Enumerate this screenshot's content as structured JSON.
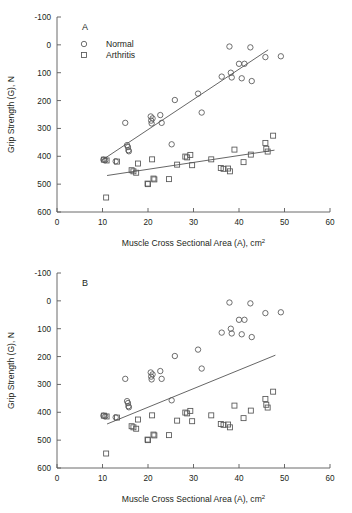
{
  "figure": {
    "panels": [
      {
        "label": "A",
        "legend": {
          "visible": true,
          "entries": [
            {
              "marker": "circle-marker",
              "label": "Normal"
            },
            {
              "marker": "square-marker",
              "label": "Arthritis"
            }
          ]
        }
      },
      {
        "label": "B",
        "legend": {
          "visible": false,
          "entries": []
        }
      }
    ]
  },
  "axis": {
    "xlabel_main": "Muscle Cross Sectional Area (A), cm",
    "xlabel_sup": "2",
    "ylabel": "Grip Strength (G), N",
    "xticks": [
      "0",
      "10",
      "20",
      "30",
      "40",
      "50",
      "60"
    ],
    "yticks": [
      "600",
      "500",
      "400",
      "300",
      "200",
      "100",
      "0",
      "-100"
    ]
  },
  "chart_data": {
    "type": "scatter",
    "title": "",
    "xlabel": "Muscle Cross Sectional Area (A), cm2",
    "ylabel": "Grip Strength (G), N",
    "xlim": [
      0,
      60
    ],
    "ylim": [
      -100,
      600
    ],
    "xticks": [
      0,
      10,
      20,
      30,
      40,
      50,
      60
    ],
    "yticks": [
      -100,
      0,
      100,
      200,
      300,
      400,
      500,
      600
    ],
    "grid": false,
    "legend_position": "upper-left",
    "panels": [
      {
        "label": "A",
        "description": "Separate regression lines fitted to Normal and Arthritis groups",
        "series": [
          {
            "name": "Normal",
            "marker": "circle",
            "points": [
              [
                10.2,
                88
              ],
              [
                10.6,
                86
              ],
              [
                12.9,
                82
              ],
              [
                15.0,
                220
              ],
              [
                15.4,
                140
              ],
              [
                15.6,
                133
              ],
              [
                15.7,
                122
              ],
              [
                15.8,
                118
              ],
              [
                20.6,
                243
              ],
              [
                20.7,
                228
              ],
              [
                20.8,
                218
              ],
              [
                21.0,
                236
              ],
              [
                22.7,
                248
              ],
              [
                23.0,
                220
              ],
              [
                25.2,
                143
              ],
              [
                25.9,
                302
              ],
              [
                31.0,
                325
              ],
              [
                31.8,
                257
              ],
              [
                36.2,
                386
              ],
              [
                37.9,
                494
              ],
              [
                38.2,
                400
              ],
              [
                38.4,
                383
              ],
              [
                40.0,
                432
              ],
              [
                40.6,
                380
              ],
              [
                41.2,
                432
              ],
              [
                42.5,
                491
              ],
              [
                42.8,
                370
              ],
              [
                45.8,
                456
              ],
              [
                49.2,
                459
              ]
            ]
          },
          {
            "name": "Arthritis",
            "marker": "square",
            "points": [
              [
                10.3,
                88
              ],
              [
                10.9,
                85
              ],
              [
                10.8,
                -48
              ],
              [
                13.2,
                81
              ],
              [
                16.4,
                50
              ],
              [
                16.8,
                46
              ],
              [
                17.4,
                41
              ],
              [
                17.8,
                74
              ],
              [
                19.9,
                2
              ],
              [
                20.0,
                0
              ],
              [
                20.9,
                89
              ],
              [
                21.2,
                20
              ],
              [
                21.4,
                17
              ],
              [
                24.6,
                18
              ],
              [
                26.4,
                70
              ],
              [
                28.2,
                99
              ],
              [
                28.6,
                96
              ],
              [
                29.3,
                105
              ],
              [
                29.7,
                68
              ],
              [
                33.9,
                89
              ],
              [
                36.0,
                58
              ],
              [
                36.6,
                55
              ],
              [
                37.6,
                56
              ],
              [
                38.0,
                46
              ],
              [
                39.0,
                124
              ],
              [
                41.0,
                79
              ],
              [
                42.6,
                106
              ],
              [
                45.8,
                148
              ],
              [
                46.0,
                127
              ],
              [
                46.3,
                117
              ],
              [
                47.5,
                174
              ]
            ]
          }
        ],
        "fit_lines": [
          {
            "name": "Normal fit",
            "x": [
              9.8,
              46.4
            ],
            "y": [
              85,
              482
            ]
          },
          {
            "name": "Arthritis fit",
            "x": [
              11.0,
              47.8
            ],
            "y": [
              31,
              122
            ]
          }
        ]
      },
      {
        "label": "B",
        "description": "Single pooled regression line fitted to all data combined",
        "series": [
          {
            "name": "Normal",
            "marker": "circle",
            "points": [
              [
                10.2,
                88
              ],
              [
                10.6,
                86
              ],
              [
                12.9,
                82
              ],
              [
                15.0,
                220
              ],
              [
                15.4,
                140
              ],
              [
                15.6,
                133
              ],
              [
                15.7,
                122
              ],
              [
                15.8,
                118
              ],
              [
                20.6,
                243
              ],
              [
                20.7,
                228
              ],
              [
                20.8,
                218
              ],
              [
                21.0,
                236
              ],
              [
                22.7,
                248
              ],
              [
                23.0,
                220
              ],
              [
                25.2,
                143
              ],
              [
                25.9,
                302
              ],
              [
                31.0,
                325
              ],
              [
                31.8,
                257
              ],
              [
                36.2,
                386
              ],
              [
                37.9,
                494
              ],
              [
                38.2,
                400
              ],
              [
                38.4,
                383
              ],
              [
                40.0,
                432
              ],
              [
                40.6,
                380
              ],
              [
                41.2,
                432
              ],
              [
                42.5,
                491
              ],
              [
                42.8,
                370
              ],
              [
                45.8,
                456
              ],
              [
                49.2,
                459
              ]
            ]
          },
          {
            "name": "Arthritis",
            "marker": "square",
            "points": [
              [
                10.3,
                88
              ],
              [
                10.9,
                85
              ],
              [
                10.8,
                -48
              ],
              [
                13.2,
                81
              ],
              [
                16.4,
                50
              ],
              [
                16.8,
                46
              ],
              [
                17.4,
                41
              ],
              [
                17.8,
                74
              ],
              [
                19.9,
                2
              ],
              [
                20.0,
                0
              ],
              [
                20.9,
                89
              ],
              [
                21.2,
                20
              ],
              [
                21.4,
                17
              ],
              [
                24.6,
                18
              ],
              [
                26.4,
                70
              ],
              [
                28.2,
                99
              ],
              [
                28.6,
                96
              ],
              [
                29.3,
                105
              ],
              [
                29.7,
                68
              ],
              [
                33.9,
                89
              ],
              [
                36.0,
                58
              ],
              [
                36.6,
                55
              ],
              [
                37.6,
                56
              ],
              [
                38.0,
                46
              ],
              [
                39.0,
                124
              ],
              [
                41.0,
                79
              ],
              [
                42.6,
                106
              ],
              [
                45.8,
                148
              ],
              [
                46.0,
                127
              ],
              [
                46.3,
                117
              ],
              [
                47.5,
                174
              ]
            ]
          }
        ],
        "fit_lines": [
          {
            "name": "Pooled fit",
            "x": [
              11.0,
              48.0
            ],
            "y": [
              58,
              305
            ]
          }
        ]
      }
    ]
  },
  "colors": {
    "ink": "#231f20",
    "axis": "#5a5a5a",
    "marker": "#555555",
    "background": "#ffffff"
  }
}
